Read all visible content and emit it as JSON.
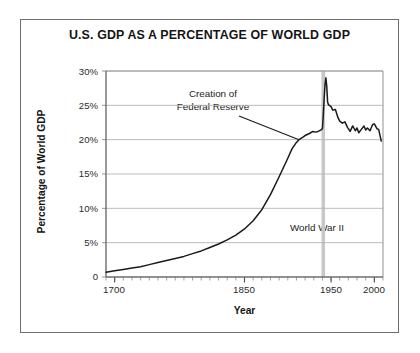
{
  "chart_data": {
    "type": "line",
    "title": "U.S. GDP AS A PERCENTAGE OF WORLD GDP",
    "xlabel": "Year",
    "ylabel": "Percentage of World GDP",
    "xlim": [
      1690,
      2010
    ],
    "ylim": [
      0,
      30
    ],
    "grid": true,
    "legend": null,
    "yticks": [
      0,
      5,
      10,
      15,
      20,
      25,
      30
    ],
    "ytick_labels": [
      "0",
      "5%",
      "10%",
      "15%",
      "20%",
      "25%",
      "30%"
    ],
    "xticks": [
      1700,
      1850,
      1950,
      2000
    ],
    "xtick_labels": [
      "1700",
      "1850",
      "1950",
      "2000"
    ],
    "minor_xtick_interval": 10,
    "series": [
      {
        "name": "U.S. GDP as percentage of world GDP",
        "color": "#1a1a1a",
        "x": [
          1690,
          1700,
          1710,
          1720,
          1730,
          1740,
          1750,
          1760,
          1770,
          1780,
          1790,
          1800,
          1810,
          1820,
          1830,
          1840,
          1850,
          1860,
          1870,
          1880,
          1890,
          1900,
          1905,
          1910,
          1913,
          1918,
          1920,
          1925,
          1929,
          1932,
          1935,
          1938,
          1940,
          1941,
          1942,
          1943,
          1944,
          1945,
          1946,
          1947,
          1948,
          1950,
          1952,
          1955,
          1958,
          1960,
          1963,
          1966,
          1969,
          1972,
          1975,
          1978,
          1980,
          1982,
          1985,
          1988,
          1990,
          1992,
          1995,
          1998,
          2000,
          2003,
          2005,
          2008
        ],
        "y": [
          0.7,
          0.9,
          1.1,
          1.3,
          1.5,
          1.8,
          2.1,
          2.4,
          2.7,
          3.0,
          3.4,
          3.8,
          4.3,
          4.8,
          5.4,
          6.1,
          7.0,
          8.2,
          9.8,
          12.0,
          14.6,
          17.3,
          18.7,
          19.6,
          20.0,
          20.4,
          20.6,
          20.9,
          21.2,
          21.1,
          21.2,
          21.4,
          21.6,
          23.5,
          26.0,
          28.0,
          29.0,
          27.8,
          25.5,
          25.1,
          25.0,
          24.8,
          24.3,
          24.4,
          23.2,
          22.7,
          22.4,
          22.6,
          21.8,
          21.2,
          22.0,
          21.3,
          21.7,
          21.0,
          21.5,
          22.0,
          21.4,
          21.7,
          21.3,
          22.2,
          22.3,
          21.6,
          21.5,
          19.8
        ]
      }
    ],
    "annotations": [
      {
        "id": "fed-reserve",
        "text_line1": "Creation of",
        "text_line2": "Federal Reserve",
        "points_to_x": 1913,
        "points_to_y": 20.0
      },
      {
        "id": "world-war-ii",
        "text": "World War II",
        "marker_type": "vertical-band",
        "marker_x": 1941,
        "marker_color": "#c8c8c8"
      }
    ]
  }
}
